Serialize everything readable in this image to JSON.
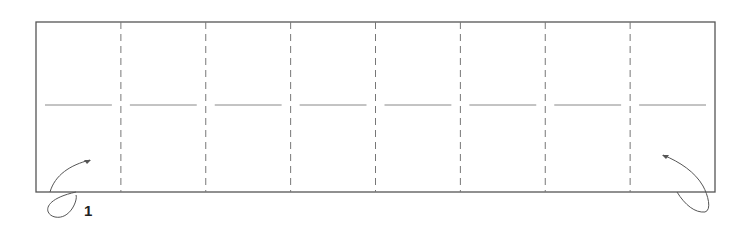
{
  "diagram": {
    "type": "origami-fold-instruction",
    "step_number": "1",
    "panels": 8,
    "valley_fold_lines": 7,
    "midline": "horizontal crease across each panel",
    "fold_arrows": [
      {
        "position": "bottom-left",
        "direction": "fold up and over toward inside"
      },
      {
        "position": "bottom-right",
        "direction": "fold up and over toward inside"
      }
    ],
    "colors": {
      "outline": "#555555",
      "dash": "#777777",
      "crease": "#888888",
      "arrow": "#555555"
    }
  }
}
